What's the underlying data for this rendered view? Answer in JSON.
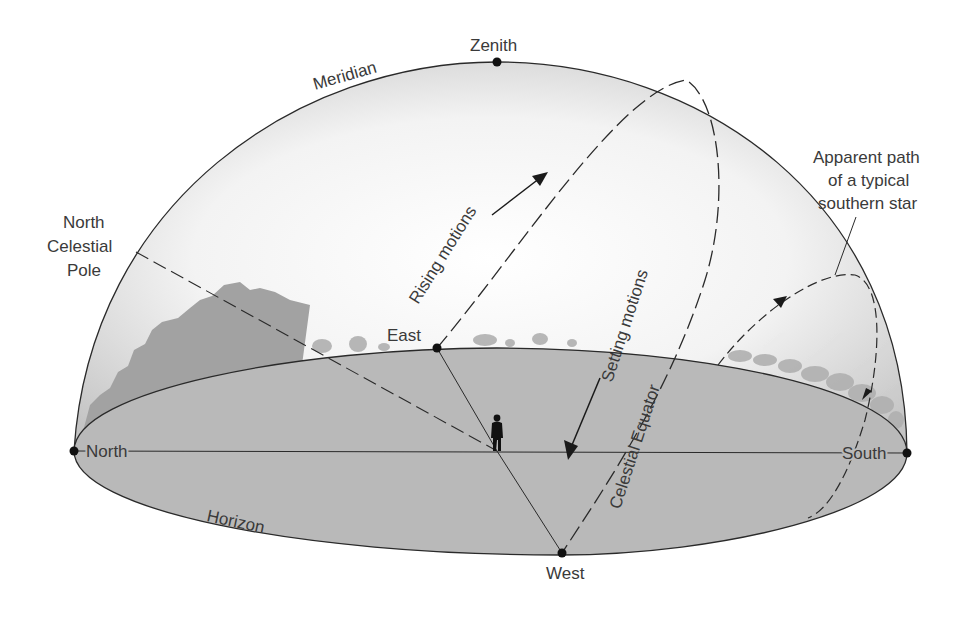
{
  "diagram": {
    "type": "celestial-sphere",
    "labels": {
      "zenith": "Zenith",
      "meridian": "Meridian",
      "north_celestial_pole": [
        "North",
        "Celestial",
        "Pole"
      ],
      "rising_motions": "Rising motions",
      "setting_motions": "Setting motions",
      "celestial_equator": "Celestial Equator",
      "southern_star_path": [
        "Apparent path",
        "of a typical",
        "southern star"
      ],
      "east": "East",
      "west": "West",
      "north": "North",
      "south": "South",
      "horizon": "Horizon"
    },
    "colors": {
      "horizon_plane": "#b9b9b9",
      "dome_edge": "#c8c8c8",
      "dome_center": "#fafafa",
      "line": "#2a2a2a",
      "text": "#3a3a3a",
      "trees": "#a8a8a8",
      "mountains": "#a2a2a2"
    },
    "icons": {
      "observer": "person-silhouette-icon",
      "rising_arrow": "arrow-up-right-icon",
      "setting_arrow": "arrow-down-left-icon"
    }
  }
}
